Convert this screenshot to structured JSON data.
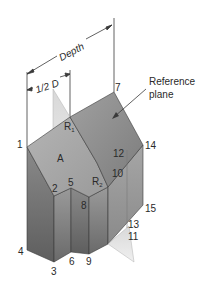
{
  "diagram": {
    "dimensions": {
      "depth_label": "Depth",
      "half_depth_label": "1/2 D"
    },
    "callout": {
      "line1": "Reference",
      "line2": "plane"
    },
    "face_labels": {
      "A": "A",
      "R1_main": "R",
      "R1_sub": "1",
      "R2_main": "R",
      "R2_sub": "2"
    },
    "vertices": {
      "v1": "1",
      "v2": "2",
      "v3": "3",
      "v4": "4",
      "v5": "5",
      "v6": "6",
      "v7": "7",
      "v8": "8",
      "v9": "9",
      "v10": "10",
      "v11": "11",
      "v12": "12",
      "v13": "13",
      "v14": "14",
      "v15": "15"
    },
    "colors": {
      "top_face": "#a8a8a8",
      "front_dark": "#6e6e6e",
      "front_mid": "#8c8c8c",
      "plane": "#d9d9d9",
      "line": "#3a3a3a"
    }
  }
}
